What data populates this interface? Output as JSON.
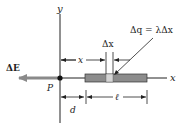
{
  "figure": {
    "axes": {
      "y_label": "y",
      "x_label": "x"
    },
    "point": {
      "label": "P"
    },
    "field_vector": {
      "label": "ΔE",
      "direction": "left",
      "color": "#8a8a8a"
    },
    "rod": {
      "color": "#8c8c8c",
      "element_color": "#d4d4d4"
    },
    "charge_element": {
      "label": "Δq = λΔx"
    },
    "dimensions": {
      "x": "x",
      "dx": "Δx",
      "d": "d",
      "l": "ℓ"
    }
  }
}
